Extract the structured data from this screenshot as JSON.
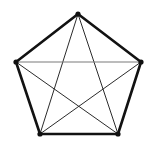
{
  "figure": {
    "background_color": "#ffffff",
    "width": 154,
    "height": 152
  },
  "chart_data": {
    "type": "diagram",
    "graph_name": "K5",
    "vertex_count": 5,
    "edge_count": 10,
    "vertices": [
      {
        "id": "v1",
        "label": "top",
        "x": 78,
        "y": 14,
        "radius": 2.6
      },
      {
        "id": "v2",
        "label": "right",
        "x": 141,
        "y": 62,
        "radius": 2.6
      },
      {
        "id": "v3",
        "label": "bottom-right",
        "x": 118,
        "y": 134,
        "radius": 2.6
      },
      {
        "id": "v4",
        "label": "bottom-left",
        "x": 40,
        "y": 134,
        "radius": 2.6
      },
      {
        "id": "v5",
        "label": "left",
        "x": 16,
        "y": 62,
        "radius": 2.6
      }
    ],
    "edges": [
      {
        "id": "e-v1-v2",
        "from": "v1",
        "to": "v2",
        "kind": "outer",
        "color": "#121212",
        "width": 2.6
      },
      {
        "id": "e-v2-v3",
        "from": "v2",
        "to": "v3",
        "kind": "outer",
        "color": "#121212",
        "width": 2.6
      },
      {
        "id": "e-v3-v4",
        "from": "v3",
        "to": "v4",
        "kind": "outer",
        "color": "#121212",
        "width": 2.6
      },
      {
        "id": "e-v4-v5",
        "from": "v4",
        "to": "v5",
        "kind": "outer",
        "color": "#121212",
        "width": 2.6
      },
      {
        "id": "e-v5-v1",
        "from": "v5",
        "to": "v1",
        "kind": "outer",
        "color": "#121212",
        "width": 2.6
      },
      {
        "id": "e-v1-v3",
        "from": "v1",
        "to": "v3",
        "kind": "diagonal",
        "color": "#2b2b2b",
        "width": 1.0
      },
      {
        "id": "e-v1-v4",
        "from": "v1",
        "to": "v4",
        "kind": "diagonal",
        "color": "#2b2b2b",
        "width": 1.0
      },
      {
        "id": "e-v2-v4",
        "from": "v2",
        "to": "v4",
        "kind": "diagonal",
        "color": "#2b2b2b",
        "width": 1.0
      },
      {
        "id": "e-v3-v5",
        "from": "v3",
        "to": "v5",
        "kind": "diagonal",
        "color": "#2b2b2b",
        "width": 1.0
      },
      {
        "id": "e-v5-v2",
        "from": "v5",
        "to": "v2",
        "kind": "diagonal",
        "color": "#7a7a7a",
        "width": 1.1
      }
    ],
    "vertex_color": "#101010",
    "title": "",
    "xlabel": "",
    "ylabel": "",
    "legend": []
  }
}
